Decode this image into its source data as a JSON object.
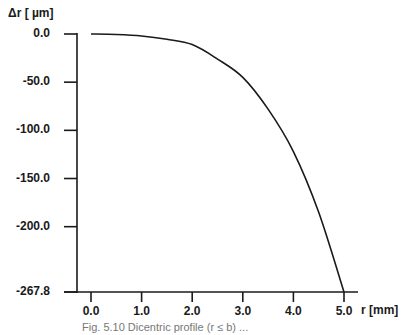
{
  "chart_data": {
    "type": "line",
    "title": "",
    "ylabel": "Δr [ µm]",
    "xlabel": "r [mm]",
    "x_ticks": [
      "0.0",
      "1.0",
      "2.0",
      "3.0",
      "4.0",
      "5.0"
    ],
    "y_ticks": [
      "0.0",
      "-50.0",
      "-100.0",
      "-150.0",
      "-200.0",
      "-267.8"
    ],
    "xlim": [
      0.0,
      5.0
    ],
    "ylim": [
      -267.8,
      0.0
    ],
    "grid": false,
    "legend": null,
    "series": [
      {
        "name": "Δr",
        "x": [
          0.0,
          0.5,
          1.0,
          1.5,
          2.0,
          2.5,
          3.0,
          3.5,
          4.0,
          4.5,
          5.0
        ],
        "y": [
          0.0,
          -0.5,
          -2.0,
          -5.5,
          -11.0,
          -26.0,
          -45.0,
          -78.0,
          -122.0,
          -185.0,
          -267.8
        ]
      }
    ],
    "caption": "Fig. 5.10   Dicentric profile (r ≤ b) ..."
  }
}
